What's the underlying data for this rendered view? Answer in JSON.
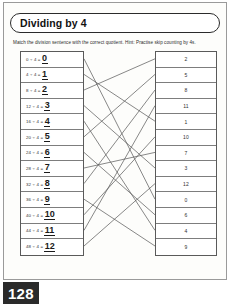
{
  "page": {
    "title": "Dividing by 4",
    "instructions": "Match the division sentence with the correct quotient. Hint: Practise skip counting by 4s.",
    "page_number": "128"
  },
  "worksheet": {
    "type": "matching",
    "left_column_label": "division sentences",
    "right_column_label": "quotients",
    "problems": [
      {
        "dividend": "0",
        "divisor": "4",
        "equation": "0 ÷ 4 =",
        "answer": "0"
      },
      {
        "dividend": "4",
        "divisor": "4",
        "equation": "4 ÷ 4 =",
        "answer": "1"
      },
      {
        "dividend": "8",
        "divisor": "4",
        "equation": "8 ÷ 4 =",
        "answer": "2"
      },
      {
        "dividend": "12",
        "divisor": "4",
        "equation": "12 ÷ 4 =",
        "answer": "3"
      },
      {
        "dividend": "16",
        "divisor": "4",
        "equation": "16 ÷ 4 =",
        "answer": "4"
      },
      {
        "dividend": "20",
        "divisor": "4",
        "equation": "20 ÷ 4 =",
        "answer": "5"
      },
      {
        "dividend": "24",
        "divisor": "4",
        "equation": "24 ÷ 4 =",
        "answer": "6"
      },
      {
        "dividend": "28",
        "divisor": "4",
        "equation": "28 ÷ 4 =",
        "answer": "7"
      },
      {
        "dividend": "32",
        "divisor": "4",
        "equation": "32 ÷ 4 =",
        "answer": "8"
      },
      {
        "dividend": "36",
        "divisor": "4",
        "equation": "36 ÷ 4 =",
        "answer": "9"
      },
      {
        "dividend": "40",
        "divisor": "4",
        "equation": "40 ÷ 4 =",
        "answer": "10"
      },
      {
        "dividend": "44",
        "divisor": "4",
        "equation": "44 ÷ 4 =",
        "answer": "11"
      },
      {
        "dividend": "48",
        "divisor": "4",
        "equation": "48 ÷ 4 =",
        "answer": "12"
      }
    ],
    "quotient_choices": [
      {
        "value": "2"
      },
      {
        "value": "5"
      },
      {
        "value": "8"
      },
      {
        "value": "11"
      },
      {
        "value": "1"
      },
      {
        "value": "10"
      },
      {
        "value": "7"
      },
      {
        "value": "3"
      },
      {
        "value": "12"
      },
      {
        "value": "0"
      },
      {
        "value": "6"
      },
      {
        "value": "4"
      },
      {
        "value": "9"
      }
    ],
    "connections": [
      {
        "left_index": 0,
        "right_index": 9
      },
      {
        "left_index": 1,
        "right_index": 4
      },
      {
        "left_index": 2,
        "right_index": 0
      },
      {
        "left_index": 3,
        "right_index": 7
      },
      {
        "left_index": 4,
        "right_index": 11
      },
      {
        "left_index": 5,
        "right_index": 1
      },
      {
        "left_index": 6,
        "right_index": 10
      },
      {
        "left_index": 7,
        "right_index": 6
      },
      {
        "left_index": 8,
        "right_index": 2
      },
      {
        "left_index": 9,
        "right_index": 12
      },
      {
        "left_index": 10,
        "right_index": 5
      },
      {
        "left_index": 11,
        "right_index": 3
      },
      {
        "left_index": 12,
        "right_index": 8
      }
    ]
  },
  "colors": {
    "line": "#555555",
    "border": "#5a5a5a",
    "page_number_bg": "#2a2a2a",
    "text": "#2d2d2d"
  }
}
